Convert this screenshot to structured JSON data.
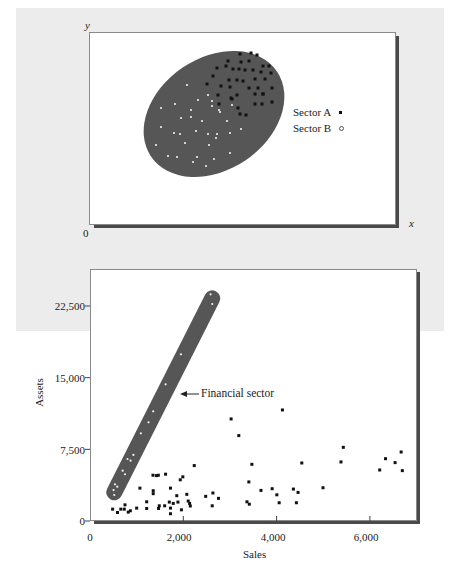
{
  "chart_data": [
    {
      "type": "scatter",
      "title": "",
      "description": "Conceptual scatter: elliptical cluster with two sectors",
      "xlabel": "x",
      "ylabel": "y",
      "origin_label": "0",
      "grid": false,
      "legend": [
        {
          "name": "Sector A",
          "marker": "filled-square",
          "color": "#000000"
        },
        {
          "name": "Sector B",
          "marker": "open-circle",
          "color": "#ffffff"
        }
      ],
      "legend_position": "right-inside",
      "cluster_shape": {
        "type": "ellipse",
        "fill": "#555555",
        "rotation_deg": -32
      },
      "series": [
        {
          "name": "Sector A",
          "points_px": [
            [
              240,
              54
            ],
            [
              251,
              53
            ],
            [
              257,
              55
            ],
            [
              228,
              61
            ],
            [
              241,
              62
            ],
            [
              249,
              61
            ],
            [
              263,
              66
            ],
            [
              269,
              66
            ],
            [
              217,
              68
            ],
            [
              226,
              66
            ],
            [
              233,
              69
            ],
            [
              239,
              69
            ],
            [
              245,
              70
            ],
            [
              253,
              70
            ],
            [
              261,
              72
            ],
            [
              271,
              73
            ],
            [
              213,
              76
            ],
            [
              229,
              80
            ],
            [
              237,
              80
            ],
            [
              243,
              81
            ],
            [
              255,
              79
            ],
            [
              265,
              79
            ],
            [
              207,
              84
            ],
            [
              221,
              86
            ],
            [
              230,
              87
            ],
            [
              249,
              88
            ],
            [
              258,
              88
            ],
            [
              263,
              94
            ],
            [
              272,
              88
            ],
            [
              218,
              95
            ],
            [
              231,
              98
            ],
            [
              237,
              95
            ],
            [
              255,
              94
            ],
            [
              263,
              94
            ],
            [
              219,
              104
            ],
            [
              255,
              104
            ],
            [
              262,
              104
            ],
            [
              272,
              102
            ],
            [
              238,
              108
            ],
            [
              240,
              114
            ],
            [
              246,
              115
            ],
            [
              232,
              99
            ]
          ]
        },
        {
          "name": "Sector B",
          "points_px": [
            [
              187,
              85
            ],
            [
              161,
              108
            ],
            [
              175,
              104
            ],
            [
              191,
              110
            ],
            [
              198,
              100
            ],
            [
              212,
              101
            ],
            [
              208,
              95
            ],
            [
              212,
              106
            ],
            [
              232,
              105
            ],
            [
              219,
              110
            ],
            [
              181,
              118
            ],
            [
              191,
              117
            ],
            [
              202,
              121
            ],
            [
              220,
              112
            ],
            [
              227,
              121
            ],
            [
              161,
              127
            ],
            [
              174,
              133
            ],
            [
              180,
              134
            ],
            [
              196,
              131
            ],
            [
              208,
              134
            ],
            [
              217,
              134
            ],
            [
              216,
              138
            ],
            [
              230,
              133
            ],
            [
              241,
              129
            ],
            [
              156,
              145
            ],
            [
              185,
              143
            ],
            [
              209,
              145
            ],
            [
              168,
              156
            ],
            [
              177,
              157
            ],
            [
              197,
              157
            ],
            [
              214,
              159
            ],
            [
              230,
              153
            ],
            [
              193,
              162
            ],
            [
              206,
              166
            ]
          ]
        }
      ]
    },
    {
      "type": "scatter",
      "title": "",
      "xlabel": "Sales",
      "ylabel": "Assets",
      "xlim": [
        0,
        7000
      ],
      "ylim": [
        0,
        25000
      ],
      "xticks": [
        0,
        2000,
        4000,
        6000
      ],
      "xtick_labels": [
        "0",
        "2,000",
        "4,000",
        "6,000"
      ],
      "yticks": [
        0,
        7500,
        15000,
        22500
      ],
      "ytick_labels": [
        "0",
        "7,500",
        "15,000",
        "22,500"
      ],
      "grid": false,
      "annotations": [
        {
          "text": "Financial sector",
          "arrow_to": [
            1900,
            13300
          ],
          "style": "arrow-left"
        }
      ],
      "highlight_band": {
        "label": "Financial sector",
        "fill": "#555555",
        "from": [
          520,
          3000
        ],
        "to": [
          2620,
          23300
        ]
      },
      "series": [
        {
          "name": "Financial sector",
          "marker": "open-circle",
          "x": [
            2585,
            2620,
            1950,
            1620,
            1355,
            1255,
            1090,
            930,
            805,
            870,
            700,
            750,
            535,
            585,
            505,
            520
          ],
          "y": [
            23720,
            22710,
            17440,
            14300,
            11480,
            10330,
            9180,
            6910,
            6490,
            6310,
            5270,
            4890,
            3840,
            3590,
            3240,
            2720
          ]
        },
        {
          "name": "Other firms",
          "marker": "filled-square",
          "x": [
            485,
            590,
            660,
            735,
            750,
            820,
            865,
            1000,
            1070,
            1215,
            1215,
            1350,
            1425,
            1465,
            1355,
            1355,
            1470,
            1485,
            1600,
            1620,
            1725,
            1700,
            1725,
            1725,
            1785,
            1860,
            1885,
            1935,
            1990,
            1960,
            2075,
            2105,
            2135,
            2150,
            2235,
            2480,
            2620,
            2635,
            2755,
            3025,
            3190,
            3405,
            3365,
            3415,
            3470,
            3665,
            3905,
            4005,
            4055,
            4125,
            4360,
            4460,
            4425,
            4540,
            4995,
            5380,
            5430,
            6210,
            6335,
            6540,
            6670,
            6695
          ],
          "y": [
            1240,
            890,
            1240,
            1240,
            1690,
            930,
            1070,
            1350,
            3440,
            2010,
            1310,
            4790,
            4750,
            4790,
            3170,
            2860,
            1310,
            1590,
            1590,
            4900,
            3440,
            1980,
            1350,
            760,
            1840,
            2650,
            1980,
            4310,
            4620,
            1170,
            2790,
            2090,
            1840,
            1570,
            5800,
            2580,
            1590,
            2930,
            2370,
            10680,
            8940,
            4090,
            2010,
            1760,
            5930,
            3200,
            3380,
            2740,
            1910,
            11620,
            3340,
            2990,
            1910,
            6070,
            3480,
            6180,
            7710,
            5340,
            6520,
            6110,
            7220,
            5270
          ]
        }
      ]
    }
  ],
  "top_chart": {
    "y_axis_label": "y",
    "x_axis_label": "x",
    "origin_label": "0",
    "legend": {
      "sector_a_label": "Sector A",
      "sector_a_marker": "▪",
      "sector_b_label": "Sector B",
      "sector_b_marker": "◦"
    }
  },
  "bottom_chart": {
    "x_axis_title": "Sales",
    "y_axis_title": "Assets",
    "y_ticks": [
      "22,500",
      "15,000",
      "7,500",
      "0"
    ],
    "x_ticks": [
      "0",
      "2,000",
      "4,000",
      "6,000"
    ],
    "annotation": "Financial sector",
    "annotation_arrow": "←"
  },
  "colors": {
    "page_background": "#ececec",
    "plot_background": "#ffffff",
    "shadow": "#4a4a4a",
    "cluster_fill": "#565656",
    "marker_dark": "#111111",
    "marker_light": "#f4f4f4",
    "text": "#222222"
  }
}
